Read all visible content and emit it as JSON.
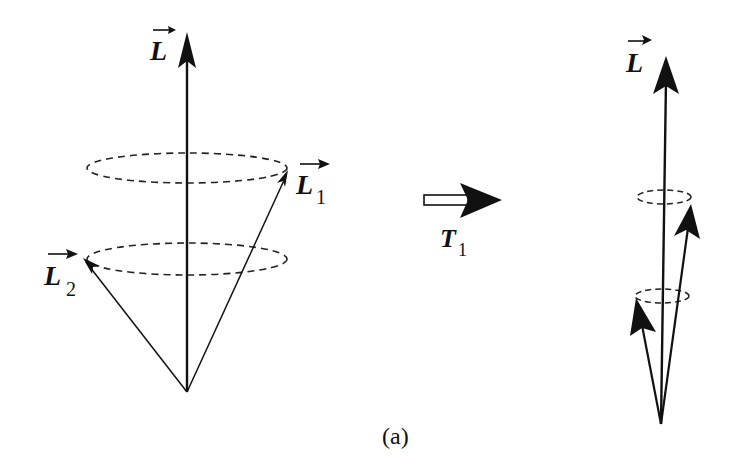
{
  "figure": {
    "caption": "(a)",
    "colors": {
      "ink": "#111111",
      "background": "#ffffff"
    }
  },
  "left_panel": {
    "total_vector": {
      "symbol": "L",
      "subscript": ""
    },
    "vector_1": {
      "symbol": "L",
      "subscript": "1"
    },
    "vector_2": {
      "symbol": "L",
      "subscript": "2"
    },
    "precession_cones": 2
  },
  "transition": {
    "symbol": "T",
    "subscript": "1"
  },
  "right_panel": {
    "total_vector": {
      "symbol": "L",
      "subscript": ""
    },
    "precession_cones": 2
  }
}
